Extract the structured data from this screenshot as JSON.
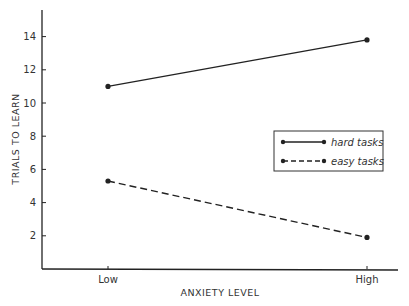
{
  "chart_data": {
    "type": "line",
    "title": "",
    "xlabel": "ANXIETY LEVEL",
    "ylabel": "TRIALS TO LEARN",
    "categories": [
      "Low",
      "High"
    ],
    "yticks": [
      2,
      4,
      6,
      8,
      10,
      12,
      14
    ],
    "ylim": [
      0,
      15.5
    ],
    "grid": false,
    "legend_position": "right-center",
    "series": [
      {
        "name": "hard tasks",
        "style": "solid",
        "values": [
          11.0,
          13.8
        ]
      },
      {
        "name": "easy tasks",
        "style": "dashed",
        "values": [
          5.3,
          1.9
        ]
      }
    ]
  },
  "colors": {
    "ink": "#222222",
    "background": "#ffffff"
  }
}
